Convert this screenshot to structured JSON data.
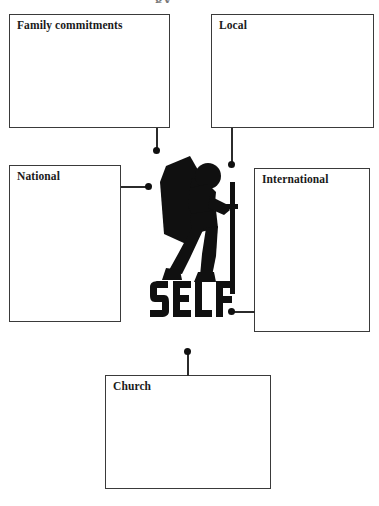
{
  "page": {
    "background_color": "#ffffff",
    "line_color": "#2b2b2b",
    "box_border_color": "#3a3a3a",
    "text_color": "#1a1a1a",
    "figure_color": "#101010",
    "top_cut_fragment": "gy"
  },
  "center": {
    "word": "SELF",
    "icon": "hiker-with-backpack-icon"
  },
  "boxes": [
    {
      "id": "family",
      "label": "Family commitments",
      "value": ""
    },
    {
      "id": "local",
      "label": "Local",
      "value": ""
    },
    {
      "id": "national",
      "label": "National",
      "value": ""
    },
    {
      "id": "international",
      "label": "International",
      "value": ""
    },
    {
      "id": "church",
      "label": "Church",
      "value": ""
    }
  ],
  "connectors": [
    {
      "from": "family",
      "to": "center",
      "orientation": "vertical"
    },
    {
      "from": "local",
      "to": "center",
      "orientation": "vertical"
    },
    {
      "from": "national",
      "to": "center",
      "orientation": "horizontal"
    },
    {
      "from": "international",
      "to": "center",
      "orientation": "horizontal"
    },
    {
      "from": "church",
      "to": "center",
      "orientation": "vertical"
    }
  ]
}
